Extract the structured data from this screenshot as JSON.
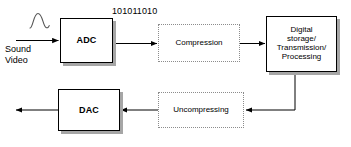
{
  "diagram": {
    "canvas": {
      "width": 351,
      "height": 147,
      "background": "#ffffff"
    },
    "colors": {
      "stroke": "#000000",
      "shadow": "#a6a6a6",
      "dotted_border": "#8c8c8c",
      "node_fill": "#ffffff",
      "text": "#000000"
    },
    "labels": {
      "source": "Sound\nVideo",
      "bitstream": "101011010"
    },
    "nodes": [
      {
        "id": "adc",
        "label": "ADC",
        "style": "solid"
      },
      {
        "id": "compression",
        "label": "Compression",
        "style": "dotted"
      },
      {
        "id": "digital_storage",
        "label": "Digital\nstorage/\nTransmission/\nProcessing",
        "style": "solid"
      },
      {
        "id": "uncompressing",
        "label": "Uncompressing",
        "style": "dotted"
      },
      {
        "id": "dac",
        "label": "DAC",
        "style": "solid"
      }
    ],
    "icons": {
      "analog_waveform": "sine-wave-icon"
    },
    "edges": [
      {
        "from": "source",
        "to": "adc",
        "arrow": true
      },
      {
        "from": "adc",
        "to": "compression",
        "arrow": true
      },
      {
        "from": "compression",
        "to": "digital_storage",
        "arrow": true
      },
      {
        "from": "digital_storage",
        "to": "uncompressing",
        "arrow": true
      },
      {
        "from": "uncompressing",
        "to": "dac",
        "arrow": true
      },
      {
        "from": "dac",
        "to": "output",
        "arrow": true
      }
    ]
  }
}
